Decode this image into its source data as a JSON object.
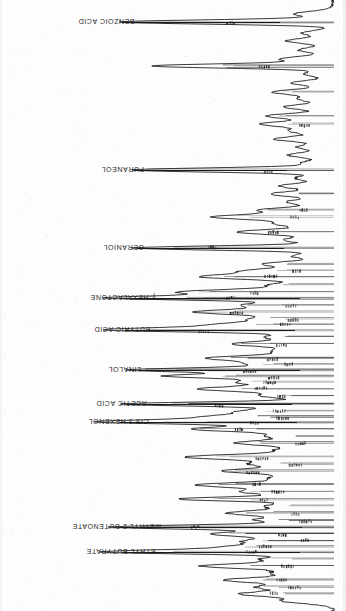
{
  "figure": {
    "kind": "gas-chromatogram-scan",
    "orientation": "rotated-180",
    "background_color": "#fdfdfd",
    "trace_color": "#141414",
    "baseline_x": 335,
    "time_axis": "vertical"
  },
  "chart_data": {
    "type": "line",
    "title": "",
    "subtitle": "",
    "xlabel": "",
    "ylabel": "",
    "legend": [],
    "grid": false,
    "orientation": "horizontal-peaks",
    "axis_note": "Retention time increases downward; detector response increases leftward from the baseline at the right edge.",
    "baseline_x": 335,
    "xlim": [
      100,
      340
    ],
    "ylim": [
      0,
      611
    ],
    "annotations": [
      {
        "label": "BENZOIC ACID",
        "y": 22,
        "label_x": 78,
        "leader_from": 122,
        "leader_to": 280,
        "peak_height": 213
      },
      {
        "label": "FURANEOL",
        "y": 170,
        "label_x": 101,
        "leader_from": 134,
        "leader_to": 287,
        "peak_height": 201
      },
      {
        "label": "GERANIOL",
        "y": 248,
        "label_x": 103,
        "leader_from": 137,
        "leader_to": 284,
        "peak_height": 198
      },
      {
        "label": "γ-HEXALACTONE",
        "y": 298,
        "label_x": 90,
        "leader_from": 120,
        "leader_to": 300,
        "peak_height": 215
      },
      {
        "label": "BUTYRIC ACID",
        "y": 330,
        "label_x": 94,
        "leader_from": 125,
        "leader_to": 295,
        "peak_height": 210
      },
      {
        "label": "LINALOL",
        "y": 370,
        "label_x": 108,
        "leader_from": 138,
        "leader_to": 300,
        "peak_height": 197
      },
      {
        "label": "ACETIC ACID",
        "y": 404,
        "label_x": 96,
        "leader_from": 127,
        "leader_to": 292,
        "peak_height": 208
      },
      {
        "label": "CIS 3 HEXENOL",
        "y": 422,
        "label_x": 88,
        "leader_from": 120,
        "leader_to": 297,
        "peak_height": 215
      },
      {
        "label": "METHYL 2 BUTENOATE",
        "y": 527,
        "label_x": 72,
        "leader_from": 118,
        "leader_to": 302,
        "peak_height": 217
      },
      {
        "label": "ETHYL BUTYRATE",
        "y": 552,
        "label_x": 86,
        "leader_from": 122,
        "leader_to": 300,
        "peak_height": 213
      }
    ],
    "peaks": [
      {
        "y": 14,
        "height": 38
      },
      {
        "y": 22,
        "height": 213
      },
      {
        "y": 33,
        "height": 30
      },
      {
        "y": 41,
        "height": 46
      },
      {
        "y": 50,
        "height": 34
      },
      {
        "y": 59,
        "height": 52
      },
      {
        "y": 66,
        "height": 180
      },
      {
        "y": 74,
        "height": 29
      },
      {
        "y": 83,
        "height": 41
      },
      {
        "y": 92,
        "height": 60
      },
      {
        "y": 99,
        "height": 33
      },
      {
        "y": 107,
        "height": 48
      },
      {
        "y": 116,
        "height": 66
      },
      {
        "y": 124,
        "height": 72
      },
      {
        "y": 131,
        "height": 42
      },
      {
        "y": 139,
        "height": 58
      },
      {
        "y": 147,
        "height": 35
      },
      {
        "y": 155,
        "height": 44
      },
      {
        "y": 163,
        "height": 30
      },
      {
        "y": 170,
        "height": 201
      },
      {
        "y": 178,
        "height": 37
      },
      {
        "y": 186,
        "height": 52
      },
      {
        "y": 194,
        "height": 62
      },
      {
        "y": 202,
        "height": 45
      },
      {
        "y": 210,
        "height": 70
      },
      {
        "y": 217,
        "height": 118
      },
      {
        "y": 224,
        "height": 55
      },
      {
        "y": 232,
        "height": 95
      },
      {
        "y": 240,
        "height": 48
      },
      {
        "y": 248,
        "height": 198
      },
      {
        "y": 256,
        "height": 40
      },
      {
        "y": 264,
        "height": 68
      },
      {
        "y": 271,
        "height": 82
      },
      {
        "y": 277,
        "height": 125
      },
      {
        "y": 285,
        "height": 60
      },
      {
        "y": 292,
        "height": 150
      },
      {
        "y": 298,
        "height": 215
      },
      {
        "y": 305,
        "height": 88
      },
      {
        "y": 312,
        "height": 135
      },
      {
        "y": 319,
        "height": 72
      },
      {
        "y": 325,
        "height": 110
      },
      {
        "y": 330,
        "height": 210
      },
      {
        "y": 337,
        "height": 65
      },
      {
        "y": 344,
        "height": 98
      },
      {
        "y": 351,
        "height": 55
      },
      {
        "y": 358,
        "height": 120
      },
      {
        "y": 364,
        "height": 75
      },
      {
        "y": 370,
        "height": 197
      },
      {
        "y": 376,
        "height": 160
      },
      {
        "y": 382,
        "height": 90
      },
      {
        "y": 389,
        "height": 130
      },
      {
        "y": 396,
        "height": 70
      },
      {
        "y": 404,
        "height": 208
      },
      {
        "y": 411,
        "height": 86
      },
      {
        "y": 417,
        "height": 115
      },
      {
        "y": 422,
        "height": 215
      },
      {
        "y": 429,
        "height": 140
      },
      {
        "y": 436,
        "height": 62
      },
      {
        "y": 443,
        "height": 95
      },
      {
        "y": 450,
        "height": 52
      },
      {
        "y": 457,
        "height": 145
      },
      {
        "y": 464,
        "height": 78
      },
      {
        "y": 471,
        "height": 108
      },
      {
        "y": 478,
        "height": 58
      },
      {
        "y": 485,
        "height": 132
      },
      {
        "y": 492,
        "height": 88
      },
      {
        "y": 499,
        "height": 152
      },
      {
        "y": 506,
        "height": 66
      },
      {
        "y": 513,
        "height": 102
      },
      {
        "y": 520,
        "height": 74
      },
      {
        "y": 527,
        "height": 217
      },
      {
        "y": 534,
        "height": 120
      },
      {
        "y": 541,
        "height": 80
      },
      {
        "y": 547,
        "height": 96
      },
      {
        "y": 552,
        "height": 213
      },
      {
        "y": 559,
        "height": 68
      },
      {
        "y": 566,
        "height": 128
      },
      {
        "y": 573,
        "height": 55
      },
      {
        "y": 580,
        "height": 105
      },
      {
        "y": 587,
        "height": 72
      },
      {
        "y": 594,
        "height": 90
      },
      {
        "y": 601,
        "height": 48
      }
    ]
  }
}
